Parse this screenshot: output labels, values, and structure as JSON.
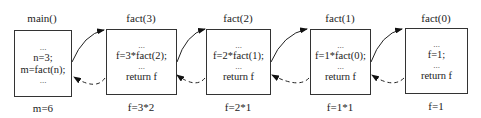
{
  "frames": [
    {
      "title": "main()",
      "lines": [
        "...",
        "n=3;",
        "m=fact(n);",
        "..."
      ],
      "result": "m=6"
    },
    {
      "title": "fact(3)",
      "lines": [
        "...",
        "f=3*fact(2);",
        "...",
        "return f"
      ],
      "result": "f=3*2"
    },
    {
      "title": "fact(2)",
      "lines": [
        "...",
        "f=2*fact(1);",
        "...",
        "return f"
      ],
      "result": "f=2*1"
    },
    {
      "title": "fact(1)",
      "lines": [
        "...",
        "f=1*fact(0);",
        "...",
        "return f"
      ],
      "result": "f=1*1"
    },
    {
      "title": "fact(0)",
      "lines": [
        "...",
        "f=1;",
        "...",
        "return f"
      ],
      "result": "f=1"
    }
  ]
}
